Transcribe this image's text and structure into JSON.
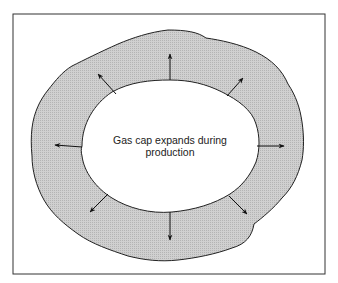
{
  "diagram": {
    "caption_line1": "Gas cap expands during",
    "caption_line2": "production",
    "colors": {
      "background": "#ffffff",
      "frame": "#333333",
      "ring_fill": "#c8c8c8",
      "outline": "#222222",
      "arrow": "#111111"
    },
    "arrows": [
      {
        "direction": "up"
      },
      {
        "direction": "up-right"
      },
      {
        "direction": "right"
      },
      {
        "direction": "down-right"
      },
      {
        "direction": "down"
      },
      {
        "direction": "down-left"
      },
      {
        "direction": "left"
      },
      {
        "direction": "up-left"
      }
    ]
  }
}
